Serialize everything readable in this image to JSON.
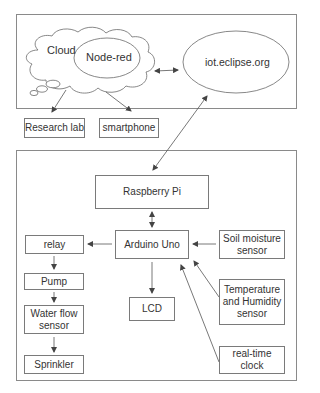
{
  "diagram": {
    "type": "system-architecture",
    "panels": [
      {
        "id": "cloud-panel",
        "label": ""
      },
      {
        "id": "device-panel",
        "label": ""
      }
    ],
    "nodes": {
      "cloud": "Cloud",
      "node_red": "Node-red",
      "iot_eclipse": "iot.eclipse.org",
      "research_lab": "Research lab",
      "smartphone": "smartphone",
      "raspberry_pi": "Raspberry Pi",
      "arduino_uno": "Arduino Uno",
      "relay": "relay",
      "pump": "Pump",
      "water_flow_sensor": "Water flow sensor",
      "sprinkler": "Sprinkler",
      "lcd": "LCD",
      "soil_moisture_sensor": "Soil moisture sensor",
      "temp_humidity_sensor": "Temperature and Humidity sensor",
      "rtc": "real-time clock"
    },
    "edges": [
      {
        "from": "Node-red",
        "to": "iot.eclipse.org",
        "direction": "bidirectional"
      },
      {
        "from": "Cloud",
        "to": "Research lab",
        "direction": "forward"
      },
      {
        "from": "Cloud",
        "to": "smartphone",
        "direction": "forward"
      },
      {
        "from": "iot.eclipse.org",
        "to": "Raspberry Pi",
        "direction": "bidirectional"
      },
      {
        "from": "Raspberry Pi",
        "to": "Arduino Uno",
        "direction": "bidirectional"
      },
      {
        "from": "Arduino Uno",
        "to": "relay",
        "direction": "forward"
      },
      {
        "from": "relay",
        "to": "Pump",
        "direction": "forward"
      },
      {
        "from": "Pump",
        "to": "Water flow sensor",
        "direction": "forward"
      },
      {
        "from": "Water flow sensor",
        "to": "Sprinkler",
        "direction": "forward"
      },
      {
        "from": "Arduino Uno",
        "to": "LCD",
        "direction": "forward"
      },
      {
        "from": "Soil moisture sensor",
        "to": "Arduino Uno",
        "direction": "forward"
      },
      {
        "from": "Temperature and Humidity sensor",
        "to": "Arduino Uno",
        "direction": "forward"
      },
      {
        "from": "real-time clock",
        "to": "Arduino Uno",
        "direction": "forward"
      }
    ]
  },
  "labels": {
    "cloud": "Cloud",
    "node_red": "Node-red",
    "iot_eclipse": "iot.eclipse.org",
    "research_lab": "Research lab",
    "smartphone": "smartphone",
    "raspberry_pi": "Raspberry Pi",
    "arduino_uno": "Arduino Uno",
    "relay": "relay",
    "pump": "Pump",
    "water_flow_line1": "Water flow",
    "water_flow_line2": "sensor",
    "sprinkler": "Sprinkler",
    "lcd": "LCD",
    "soil_line1": "Soil moisture",
    "soil_line2": "sensor",
    "temp_line1": "Temperature",
    "temp_line2": "and Humidity",
    "temp_line3": "sensor",
    "rtc_line1": "real-time",
    "rtc_line2": "clock"
  },
  "colors": {
    "stroke": "#555555",
    "border": "#7a7a7a",
    "text": "#333333",
    "background": "#ffffff"
  }
}
